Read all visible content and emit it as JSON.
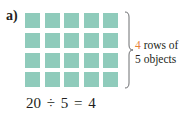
{
  "figure": {
    "label": "a)",
    "grid": {
      "rows": 4,
      "columns": 5,
      "cell_color": "#8fcbbb",
      "cells": [
        [
          1,
          1,
          1,
          1,
          1
        ],
        [
          1,
          1,
          1,
          1,
          1
        ],
        [
          1,
          1,
          1,
          1,
          1
        ],
        [
          1,
          1,
          1,
          1,
          1
        ]
      ]
    },
    "annotation": {
      "rows_count": "4",
      "rows_text": " rows of",
      "line2": "5 objects",
      "highlight_color": "#e8823a"
    },
    "equation": "20 ÷ 5 = 4"
  }
}
